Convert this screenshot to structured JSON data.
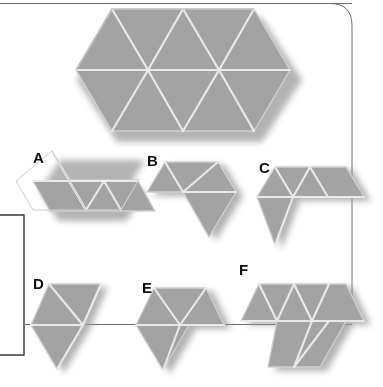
{
  "figure": {
    "type": "geometric-dissection-puzzle",
    "background_color": "#ffffff",
    "piece_fill_color": "#a3a3a3",
    "piece_fill_color_light": "#b4b4b4",
    "piece_seam_color": "#e8e8e8",
    "piece_edge_color": "#d2d2d2",
    "shadow_color": "#8d8d8d",
    "label_color": "#111111",
    "frame_line_color": "#6e6e6e"
  },
  "frame": {
    "top_rule": {
      "x1": 0,
      "y1": 3,
      "x2": 352,
      "y2": 3
    },
    "right_rounded_border": true,
    "left_bracket": true,
    "mid_rule": {
      "x1": 24,
      "y1": 324,
      "x2": 352,
      "y2": 324
    }
  },
  "main_shape": {
    "name": "target-hexagon",
    "triangle_side": 71,
    "triangle_count": 12,
    "bounds": {
      "x": 74,
      "y": 8,
      "width": 214,
      "height": 124
    }
  },
  "pieces": [
    {
      "id": "A",
      "label": "A",
      "label_x": 33,
      "label_y": 150,
      "triangle_count": 5,
      "description": "large triangle at upper-left with a three-triangle row extending to the lower right"
    },
    {
      "id": "B",
      "label": "B",
      "label_x": 147,
      "label_y": 153,
      "triangle_count": 4,
      "description": "trapezoid of three triangles with one triangle hanging below at the right"
    },
    {
      "id": "C",
      "label": "C",
      "label_x": 259,
      "label_y": 160,
      "triangle_count": 5,
      "description": "row of four triangles with one triangle hanging below at the left"
    },
    {
      "id": "D",
      "label": "D",
      "label_x": 33,
      "label_y": 276,
      "triangle_count": 4,
      "description": "rhombus of four triangles arranged in a vertical zigzag"
    },
    {
      "id": "E",
      "label": "E",
      "label_x": 142,
      "label_y": 280,
      "triangle_count": 5,
      "description": "hexagon of six triangles with the lower-right triangle removed"
    },
    {
      "id": "F",
      "label": "F",
      "label_x": 239,
      "label_y": 262,
      "triangle_count": 7,
      "description": "row of five triangles on top with two triangles stepping down at the right"
    }
  ],
  "labels": {
    "a": "A",
    "b": "B",
    "c": "C",
    "d": "D",
    "e": "E",
    "f": "F"
  }
}
